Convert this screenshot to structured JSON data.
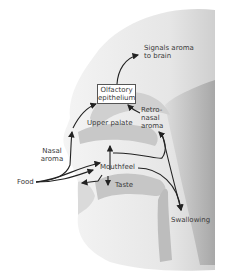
{
  "diagram": {
    "labels": {
      "signals": [
        "Signals aroma",
        "to brain"
      ],
      "olfactory": [
        "Olfactory",
        "epithelium"
      ],
      "retronasal": [
        "Retro-",
        "nasal",
        "aroma"
      ],
      "upper_palate": "Upper palate",
      "nasal_aroma": [
        "Nasal",
        "aroma"
      ],
      "food": "Food",
      "mouthfeel": "Mouthfeel",
      "taste": "Taste",
      "swallowing": "Swallowing"
    },
    "colors": {
      "arrow": "#222222",
      "text": "#3a3a3a",
      "head_light": "#ececec",
      "head_mid": "#d4d4d4",
      "head_dark": "#a8a8a8"
    }
  }
}
